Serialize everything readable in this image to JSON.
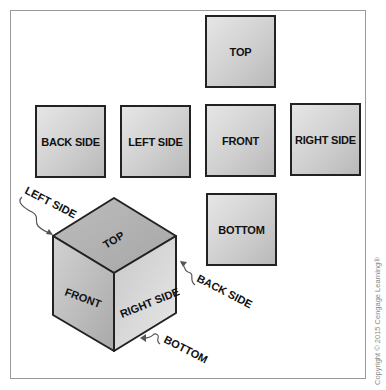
{
  "views": {
    "top": "TOP",
    "back_side": "BACK SIDE",
    "left_side": "LEFT SIDE",
    "front": "FRONT",
    "right_side": "RIGHT SIDE",
    "bottom": "BOTTOM"
  },
  "cube": {
    "faces": {
      "top": "TOP",
      "front": "FRONT",
      "right_side": "RIGHT SIDE"
    },
    "callouts": {
      "left_side": "LEFT SIDE",
      "back_side": "BACK SIDE",
      "bottom": "BOTTOM"
    }
  },
  "copyright": "Copyright © 2015 Cengage Learning®",
  "colors": {
    "face_light": "#e6e6e6",
    "face_dark": "#b9b9b9",
    "outline": "#222222",
    "frame": "#9a9a9a"
  }
}
